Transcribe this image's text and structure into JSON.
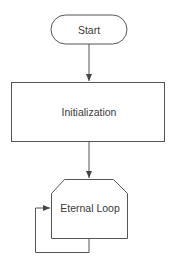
{
  "diagram": {
    "type": "flowchart",
    "stroke_color": "#555555",
    "nodes": [
      {
        "id": "start",
        "shape": "terminator",
        "label": "Start"
      },
      {
        "id": "init",
        "shape": "process",
        "label": "Initialization"
      },
      {
        "id": "loop",
        "shape": "loop-limit",
        "label": "Eternal Loop"
      }
    ],
    "edges": [
      {
        "from": "start",
        "to": "init"
      },
      {
        "from": "init",
        "to": "loop"
      },
      {
        "from": "loop",
        "to": "loop",
        "kind": "self-loop"
      }
    ]
  }
}
